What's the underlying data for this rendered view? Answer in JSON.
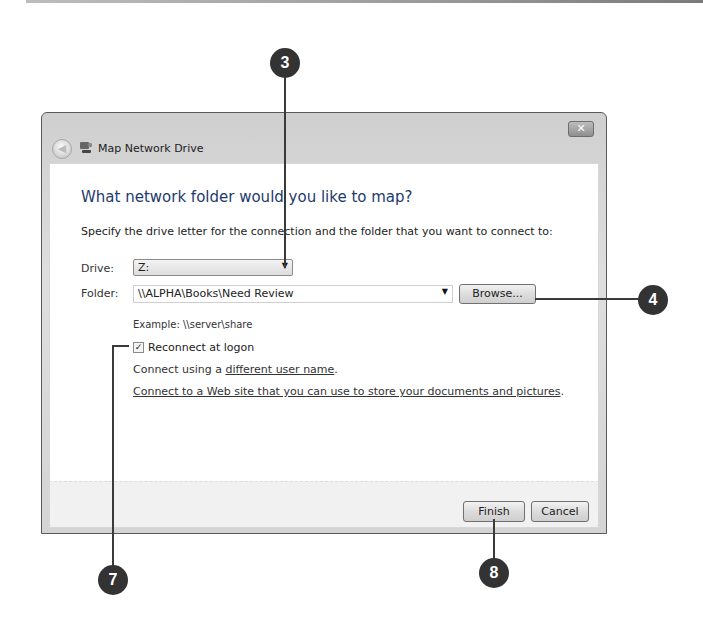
{
  "window": {
    "title": "Map Network Drive",
    "close_glyph": "✕",
    "back_glyph": "◀"
  },
  "main": {
    "heading": "What network folder would you like to map?",
    "instructions": "Specify the drive letter for the connection and the folder that you want to connect to:",
    "drive": {
      "label": "Drive:",
      "value": "Z:",
      "arrow": "▼"
    },
    "folder": {
      "label": "Folder:",
      "value": "\\\\ALPHA\\Books\\Need Review",
      "arrow": "▼"
    },
    "browse_label": "Browse...",
    "example": "Example: \\\\server\\share",
    "reconnect": {
      "label": "Reconnect at logon",
      "checked": true,
      "glyph": "✓"
    },
    "connect_prefix": "Connect using a ",
    "connect_link": "different user name",
    "connect_suffix": ".",
    "web_link": "Connect to a Web site that you can use to store your documents and pictures",
    "web_suffix": "."
  },
  "footer": {
    "finish_label": "Finish",
    "cancel_label": "Cancel"
  },
  "callouts": [
    {
      "number": "3",
      "target": "drive-select"
    },
    {
      "number": "4",
      "target": "browse-button"
    },
    {
      "number": "7",
      "target": "reconnect-checkbox"
    },
    {
      "number": "8",
      "target": "finish-button"
    }
  ],
  "colors": {
    "heading": "#1e3a6e",
    "callout": "#333333",
    "frame": "#d4d4d4"
  }
}
